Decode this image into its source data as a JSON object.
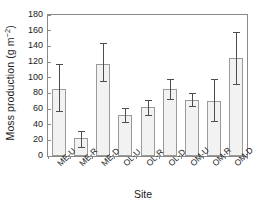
{
  "chart_data": {
    "type": "bar",
    "title": "",
    "xlabel": "Site",
    "ylabel": "Moss production (g m⁻²)",
    "ylabel_main": "Moss production (g m",
    "ylabel_sup": "−2",
    "ylabel_close": ")",
    "categories": [
      "ME-U",
      "ME-R",
      "ME-D",
      "OL-U",
      "OL-R",
      "OL-D",
      "OM-U",
      "OM-R",
      "OM-D"
    ],
    "values": [
      86,
      23,
      117,
      52,
      62,
      85,
      72,
      70,
      125
    ],
    "error_low": [
      57,
      11,
      96,
      43,
      52,
      73,
      64,
      45,
      92
    ],
    "error_high": [
      117,
      32,
      144,
      61,
      72,
      98,
      80,
      98,
      158
    ],
    "ylim": [
      0,
      180
    ],
    "yticks": [
      0,
      20,
      40,
      60,
      80,
      100,
      120,
      140,
      160,
      180
    ],
    "ytick_labels": [
      "0",
      "20",
      "40",
      "60",
      "80",
      "100",
      "120",
      "140",
      "160",
      "180"
    ],
    "grid": false,
    "legend": false,
    "bar_fill_color": "#f2f2f2",
    "bar_edge_color": "#9a9a9a",
    "error_color": "#4d4d4d",
    "axis_color": "#8a8a8a",
    "background_color": "#ffffff"
  }
}
